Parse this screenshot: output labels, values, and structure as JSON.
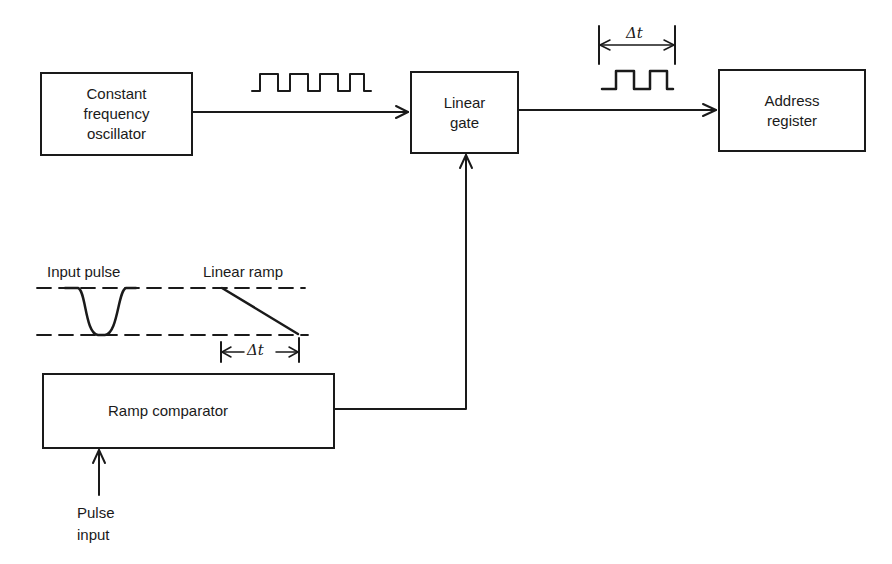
{
  "diagram": {
    "type": "block-diagram",
    "blocks": {
      "oscillator": {
        "line1": "Constant",
        "line2": "frequency",
        "line3": "oscillator"
      },
      "linear_gate": {
        "line1": "Linear",
        "line2": "gate"
      },
      "address_register": {
        "line1": "Address",
        "line2": "register"
      },
      "ramp_comparator": {
        "label": "Ramp comparator"
      }
    },
    "labels": {
      "input_pulse": "Input pulse",
      "linear_ramp": "Linear ramp",
      "pulse_input_line1": "Pulse",
      "pulse_input_line2": "input",
      "delta_t_top": "Δt",
      "delta_t_ramp": "Δt"
    },
    "connections": [
      {
        "from": "oscillator",
        "to": "linear_gate",
        "signal": "square wave (continuous pulse train)"
      },
      {
        "from": "linear_gate",
        "to": "address_register",
        "signal": "gated pulses of duration Δt"
      },
      {
        "from": "ramp_comparator",
        "to": "linear_gate",
        "signal": "gate control"
      },
      {
        "from": "pulse_input",
        "to": "ramp_comparator",
        "signal": "input pulse"
      }
    ],
    "colors": {
      "ink": "#1a1a1a",
      "background": "#ffffff"
    }
  }
}
